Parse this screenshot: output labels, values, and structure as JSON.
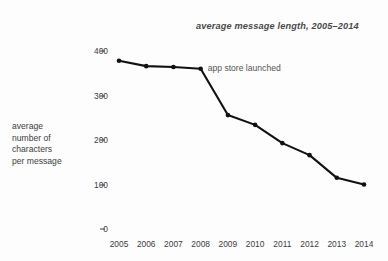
{
  "chart_data": {
    "type": "line",
    "title": "average message length, 2005–2014",
    "xlabel": "",
    "ylabel": "average\nnumber of\ncharacters\nper message",
    "categories": [
      "2005",
      "2006",
      "2007",
      "2008",
      "2009",
      "2010",
      "2011",
      "2012",
      "2013",
      "2014"
    ],
    "x": [
      2005,
      2006,
      2007,
      2008,
      2009,
      2010,
      2011,
      2012,
      2013,
      2014
    ],
    "values": [
      378,
      366,
      364,
      360,
      256,
      234,
      193,
      166,
      115,
      100
    ],
    "ylim": [
      0,
      430
    ],
    "yticks": [
      0,
      100,
      200,
      300,
      400
    ],
    "ytick_labels": [
      "0",
      "100",
      "200",
      "300",
      "400"
    ],
    "grid": false,
    "legend": null,
    "marker": "dot",
    "line_color": "#111111",
    "marker_color": "#111111",
    "annotations": [
      {
        "text": "app store launched",
        "at_x": 2008,
        "at_y": 360
      }
    ]
  },
  "chart": {
    "title": "average message length, 2005–2014",
    "y_axis_title": "average\nnumber of\ncharacters\nper message",
    "y_tick_labels": [
      "400",
      "300",
      "200",
      "100",
      "0"
    ],
    "x_tick_labels": [
      "2005",
      "2006",
      "2007",
      "2008",
      "2009",
      "2010",
      "2011",
      "2012",
      "2013",
      "2014"
    ],
    "annotation_label": "app store launched",
    "colors": {
      "background": "#fdfdfd",
      "ink": "#3c3c3c",
      "line": "#111111",
      "title": "#4a4a4a",
      "annotation": "#555555"
    }
  }
}
